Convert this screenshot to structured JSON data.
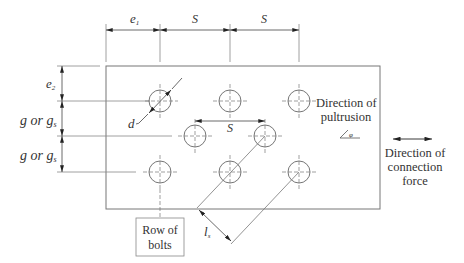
{
  "diagram": {
    "type": "bolted-connection-plate-layout",
    "dimensions": {
      "top": [
        {
          "id": "e1",
          "label": "e",
          "subscript": "1"
        },
        {
          "id": "s1",
          "label": "S"
        },
        {
          "id": "s2",
          "label": "S"
        }
      ],
      "left": [
        {
          "id": "e2",
          "label": "e",
          "subscript": "2"
        },
        {
          "id": "g1",
          "label": "g or g",
          "subscript": "s"
        },
        {
          "id": "g2",
          "label": "g or g",
          "subscript": "s"
        }
      ],
      "inner_spacing": {
        "label": "S"
      },
      "diameter": {
        "label": "d"
      },
      "diagonal": {
        "label": "l",
        "subscript": "s"
      }
    },
    "labels": {
      "pultrusion_line1": "Direction of",
      "pultrusion_line2": "pultrusion",
      "force_line1": "Direction of",
      "force_line2": "connection",
      "force_line3": "force",
      "row_line1": "Row of",
      "row_line2": "bolts"
    },
    "bolts": {
      "rows": [
        {
          "y": 101,
          "x": [
            160,
            230,
            299
          ]
        },
        {
          "y": 136,
          "x": [
            195,
            265
          ]
        },
        {
          "y": 172,
          "x": [
            160,
            230,
            299
          ]
        }
      ],
      "radius": 11
    },
    "colors": {
      "line": "#555555",
      "text": "#333333"
    }
  }
}
